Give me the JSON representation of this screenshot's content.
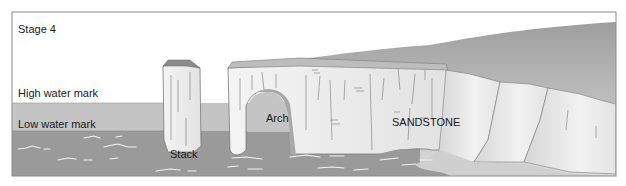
{
  "diagram": {
    "stage_label": "Stage 4",
    "labels": {
      "high_water": "High water mark",
      "low_water": "Low water mark",
      "stack": "Stack",
      "arch": "Arch",
      "rock": "SANDSTONE"
    },
    "colors": {
      "frame": "#8c8c8c",
      "sky": "#ffffff",
      "intertidal_band": "#c4c4c4",
      "sea": "#9a9a9a",
      "rock_face": "#ececec",
      "rock_top": "#8a8a8a",
      "cliff_slope": "#b5b5b5",
      "wave_marks": "#f2f2f2"
    }
  }
}
